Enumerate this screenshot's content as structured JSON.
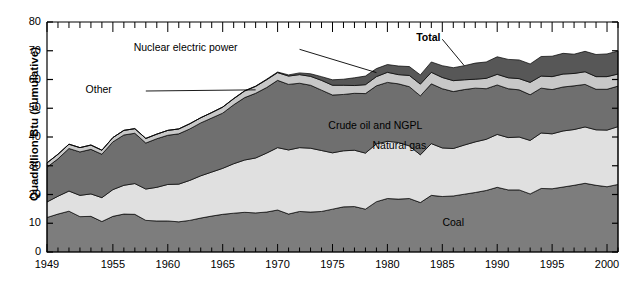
{
  "chart_data": {
    "type": "area",
    "stacked": true,
    "title": "",
    "xlabel": "",
    "ylabel": "Quadrillion Btu (cumulative)",
    "xlim": [
      1949,
      2001
    ],
    "ylim": [
      0,
      80
    ],
    "ytick_step": 10,
    "yticks": [
      0,
      10,
      20,
      30,
      40,
      50,
      60,
      70,
      80
    ],
    "xticks": [
      1949,
      1955,
      1960,
      1965,
      1970,
      1975,
      1980,
      1985,
      1990,
      1995,
      2000
    ],
    "minor_xtick_step": 1,
    "grid": false,
    "legend_position": "inline-annotations",
    "annotations": [
      {
        "text": "Total",
        "series": "Total",
        "bold": true,
        "leader": true
      },
      {
        "text": "Nuclear electric power",
        "series": "Nuclear electric power",
        "bold": false,
        "leader": true
      },
      {
        "text": "Other",
        "series": "Other",
        "bold": false,
        "leader": true
      },
      {
        "text": "Crude oil and NGPL",
        "series": "Crude oil and NGPL",
        "bold": false,
        "leader": false
      },
      {
        "text": "Natural gas",
        "series": "Natural gas",
        "bold": false,
        "leader": false
      },
      {
        "text": "Coal",
        "series": "Coal",
        "bold": false,
        "leader": false
      }
    ],
    "x": [
      1949,
      1950,
      1951,
      1952,
      1953,
      1954,
      1955,
      1956,
      1957,
      1958,
      1959,
      1960,
      1961,
      1962,
      1963,
      1964,
      1965,
      1966,
      1967,
      1968,
      1969,
      1970,
      1971,
      1972,
      1973,
      1974,
      1975,
      1976,
      1977,
      1978,
      1979,
      1980,
      1981,
      1982,
      1983,
      1984,
      1985,
      1986,
      1987,
      1988,
      1989,
      1990,
      1991,
      1992,
      1993,
      1994,
      1995,
      1996,
      1997,
      1998,
      1999,
      2000,
      2001
    ],
    "series": [
      {
        "name": "Coal",
        "color": "#7d7d7d",
        "values": [
          12.0,
          13.2,
          14.2,
          12.3,
          12.4,
          10.6,
          12.4,
          13.2,
          13.1,
          11.0,
          10.8,
          10.8,
          10.5,
          11.0,
          11.8,
          12.5,
          13.1,
          13.5,
          13.8,
          13.6,
          13.9,
          14.6,
          13.2,
          14.1,
          13.9,
          14.1,
          14.9,
          15.7,
          15.8,
          14.9,
          17.5,
          18.6,
          18.4,
          18.6,
          17.2,
          19.7,
          19.3,
          19.5,
          20.1,
          20.7,
          21.4,
          22.5,
          21.6,
          21.6,
          20.2,
          22.1,
          22.0,
          22.6,
          23.2,
          23.9,
          23.2,
          22.7,
          23.5
        ],
        "stack_order": 1
      },
      {
        "name": "Natural gas",
        "color": "#e0e0e0",
        "values": [
          5.4,
          6.2,
          7.0,
          7.4,
          7.8,
          8.3,
          9.3,
          10.0,
          10.7,
          10.9,
          11.7,
          12.7,
          13.1,
          13.9,
          14.7,
          15.3,
          16.0,
          17.2,
          18.2,
          19.1,
          20.5,
          21.7,
          22.3,
          22.2,
          22.2,
          21.2,
          19.6,
          19.5,
          19.6,
          19.5,
          20.1,
          19.9,
          19.7,
          18.3,
          16.6,
          18.0,
          16.9,
          16.5,
          17.1,
          17.6,
          17.8,
          18.4,
          18.2,
          18.4,
          18.6,
          19.3,
          19.1,
          19.5,
          19.4,
          19.6,
          19.3,
          19.7,
          20.1
        ],
        "stack_order": 2
      },
      {
        "name": "Crude oil and NGPL",
        "color": "#6f6f6f",
        "values": [
          12.1,
          13.0,
          14.8,
          15.1,
          15.5,
          15.1,
          16.6,
          17.5,
          17.5,
          16.0,
          16.9,
          17.1,
          17.5,
          17.9,
          18.4,
          18.8,
          19.2,
          20.5,
          21.7,
          22.5,
          22.8,
          23.4,
          22.8,
          22.4,
          21.9,
          21.0,
          20.1,
          19.6,
          19.8,
          20.7,
          20.2,
          20.5,
          20.4,
          20.6,
          20.5,
          20.8,
          20.6,
          19.8,
          19.3,
          18.7,
          17.6,
          17.2,
          17.0,
          16.4,
          15.9,
          15.6,
          15.4,
          15.3,
          15.2,
          14.8,
          14.1,
          14.2,
          14.1
        ],
        "stack_order": 3
      },
      {
        "name": "Other",
        "color": "#c8c8c8",
        "values": [
          1.5,
          1.6,
          1.5,
          1.5,
          1.5,
          1.4,
          1.5,
          1.6,
          1.6,
          1.6,
          1.6,
          1.7,
          1.7,
          1.8,
          1.8,
          1.9,
          2.1,
          2.1,
          2.3,
          2.4,
          2.7,
          2.7,
          2.9,
          3.0,
          3.1,
          3.4,
          3.4,
          3.2,
          2.7,
          3.1,
          3.2,
          3.5,
          3.2,
          3.9,
          4.1,
          4.0,
          3.9,
          3.8,
          3.4,
          3.1,
          3.6,
          3.7,
          3.8,
          3.9,
          4.3,
          4.2,
          4.5,
          4.5,
          4.3,
          4.4,
          4.4,
          4.4,
          4.2
        ],
        "stack_order": 4
      },
      {
        "name": "Nuclear electric power",
        "color": "#575757",
        "values": [
          0.0,
          0.0,
          0.0,
          0.0,
          0.0,
          0.0,
          0.0,
          0.0,
          0.0,
          0.0,
          0.0,
          0.0,
          0.0,
          0.0,
          0.0,
          0.0,
          0.0,
          0.1,
          0.1,
          0.1,
          0.2,
          0.2,
          0.4,
          0.6,
          0.9,
          1.3,
          1.9,
          2.1,
          2.7,
          3.0,
          2.8,
          2.7,
          3.0,
          3.1,
          3.2,
          3.6,
          4.1,
          4.5,
          4.9,
          5.6,
          5.7,
          6.1,
          6.4,
          6.5,
          6.4,
          6.8,
          7.1,
          7.2,
          6.7,
          7.1,
          7.7,
          7.9,
          8.0
        ],
        "stack_order": 5
      }
    ],
    "total": {
      "name": "Total",
      "values": [
        31.0,
        34.0,
        37.5,
        36.3,
        37.2,
        35.4,
        39.8,
        42.3,
        42.9,
        39.5,
        41.0,
        42.3,
        42.8,
        44.6,
        46.7,
        48.5,
        50.4,
        53.4,
        56.1,
        57.7,
        60.1,
        62.6,
        61.6,
        62.3,
        62.0,
        61.0,
        59.9,
        60.1,
        60.6,
        61.2,
        63.8,
        65.2,
        64.7,
        64.5,
        61.6,
        66.1,
        64.8,
        64.1,
        64.8,
        65.7,
        66.1,
        67.9,
        67.0,
        66.8,
        65.4,
        68.0,
        68.1,
        69.1,
        68.8,
        69.8,
        68.7,
        68.9,
        69.9
      ]
    },
    "plot_geometry": {
      "left_px": 47,
      "right_px": 618,
      "top_px": 22,
      "bottom_px": 252
    }
  }
}
